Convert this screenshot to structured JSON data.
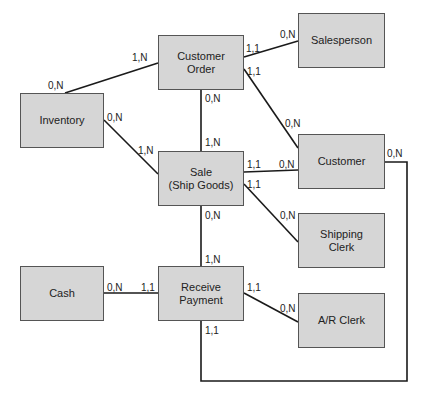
{
  "diagram": {
    "type": "REA entity-relationship diagram",
    "entities": [
      {
        "id": "customer_order",
        "label": "Customer\nOrder",
        "x": 158,
        "y": 35,
        "w": 86,
        "h": 55
      },
      {
        "id": "salesperson",
        "label": "Salesperson",
        "x": 298,
        "y": 13,
        "w": 87,
        "h": 55
      },
      {
        "id": "inventory",
        "label": "Inventory",
        "x": 20,
        "y": 93,
        "w": 84,
        "h": 55
      },
      {
        "id": "sale",
        "label": "Sale\n(Ship Goods)",
        "x": 158,
        "y": 151,
        "w": 86,
        "h": 55
      },
      {
        "id": "customer",
        "label": "Customer",
        "x": 298,
        "y": 134,
        "w": 87,
        "h": 55
      },
      {
        "id": "shipping_clerk",
        "label": "Shipping\nClerk",
        "x": 298,
        "y": 213,
        "w": 87,
        "h": 55
      },
      {
        "id": "cash",
        "label": "Cash",
        "x": 20,
        "y": 266,
        "w": 84,
        "h": 55
      },
      {
        "id": "receive_payment",
        "label": "Receive\nPayment",
        "x": 158,
        "y": 266,
        "w": 86,
        "h": 55
      },
      {
        "id": "ar_clerk",
        "label": "A/R Clerk",
        "x": 298,
        "y": 293,
        "w": 87,
        "h": 55
      }
    ],
    "relationships": [
      {
        "from": "inventory",
        "to": "customer_order",
        "from_card": "0,N",
        "to_card": "1,N"
      },
      {
        "from": "customer_order",
        "to": "salesperson",
        "from_card": "1,1",
        "to_card": "0,N"
      },
      {
        "from": "customer_order",
        "to": "customer",
        "from_card": "1,1",
        "to_card": "0,N"
      },
      {
        "from": "customer_order",
        "to": "sale",
        "from_card": "0,N",
        "to_card": "1,N"
      },
      {
        "from": "inventory",
        "to": "sale",
        "from_card": "0,N",
        "to_card": "1,N"
      },
      {
        "from": "sale",
        "to": "customer",
        "from_card": "1,1",
        "to_card": "0,N"
      },
      {
        "from": "sale",
        "to": "shipping_clerk",
        "from_card": "1,1",
        "to_card": "0,N"
      },
      {
        "from": "sale",
        "to": "receive_payment",
        "from_card": "0,N",
        "to_card": "1,N"
      },
      {
        "from": "cash",
        "to": "receive_payment",
        "from_card": "0,N",
        "to_card": "1,1"
      },
      {
        "from": "receive_payment",
        "to": "ar_clerk",
        "from_card": "1,1",
        "to_card": "0,N"
      },
      {
        "from": "receive_payment",
        "to": "customer",
        "from_card": "1,1",
        "to_card": "0,N"
      }
    ],
    "labels": [
      {
        "text": "1,N",
        "x": 132,
        "y": 53
      },
      {
        "text": "0,N",
        "x": 48,
        "y": 81
      },
      {
        "text": "1,1",
        "x": 246,
        "y": 44
      },
      {
        "text": "0,N",
        "x": 280,
        "y": 30
      },
      {
        "text": "1,1",
        "x": 247,
        "y": 67
      },
      {
        "text": "0,N",
        "x": 285,
        "y": 119
      },
      {
        "text": "0,N",
        "x": 205,
        "y": 94
      },
      {
        "text": "1,N",
        "x": 205,
        "y": 138
      },
      {
        "text": "0,N",
        "x": 107,
        "y": 113
      },
      {
        "text": "1,N",
        "x": 138,
        "y": 146
      },
      {
        "text": "1,1",
        "x": 247,
        "y": 160
      },
      {
        "text": "0,N",
        "x": 279,
        "y": 160
      },
      {
        "text": "1,1",
        "x": 247,
        "y": 180
      },
      {
        "text": "0,N",
        "x": 280,
        "y": 211
      },
      {
        "text": "0,N",
        "x": 205,
        "y": 211
      },
      {
        "text": "1,N",
        "x": 205,
        "y": 255
      },
      {
        "text": "0,N",
        "x": 107,
        "y": 283
      },
      {
        "text": "1,1",
        "x": 141,
        "y": 283
      },
      {
        "text": "1,1",
        "x": 247,
        "y": 283
      },
      {
        "text": "0,N",
        "x": 280,
        "y": 304
      },
      {
        "text": "1,1",
        "x": 205,
        "y": 326
      },
      {
        "text": "0,N",
        "x": 387,
        "y": 149
      }
    ]
  }
}
